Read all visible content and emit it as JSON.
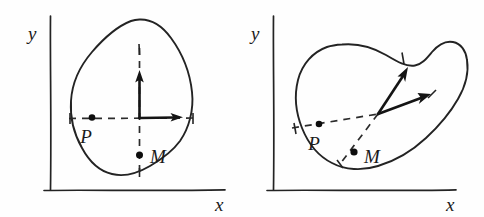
{
  "figure": {
    "title": "",
    "background_color": "#fefefe",
    "ink_color": "#232323",
    "width": 484,
    "height": 217,
    "panel_count": 2
  },
  "panels": [
    {
      "id": "left",
      "name": "unrotated-body-frame",
      "axes": {
        "x_label": "x",
        "y_label": "y",
        "x_axis_name": "horizontal-axis",
        "y_axis_name": "vertical-axis"
      },
      "body": {
        "name": "rigid-body-outline",
        "shape": "teardrop"
      },
      "points": [
        {
          "label": "P",
          "name": "point-p",
          "role": "material-point"
        },
        {
          "label": "M",
          "name": "point-m",
          "role": "mass-center"
        }
      ],
      "vectors": [
        {
          "name": "body-frame-axis-vertical",
          "direction": "up"
        },
        {
          "name": "body-frame-axis-horizontal",
          "direction": "right"
        }
      ],
      "guides": [
        {
          "name": "horizontal-dashed-guide",
          "style": "dashed"
        },
        {
          "name": "vertical-dashed-guide",
          "style": "dashed"
        }
      ]
    },
    {
      "id": "right",
      "name": "rotated-deformed-body-frame",
      "axes": {
        "x_label": "x",
        "y_label": "y",
        "x_axis_name": "horizontal-axis",
        "y_axis_name": "vertical-axis"
      },
      "body": {
        "name": "rigid-body-outline",
        "shape": "kidney"
      },
      "points": [
        {
          "label": "P",
          "name": "point-p",
          "role": "material-point"
        },
        {
          "label": "M",
          "name": "point-m",
          "role": "mass-center"
        }
      ],
      "vectors": [
        {
          "name": "body-frame-axis-rotated-1",
          "direction": "up-right-steep"
        },
        {
          "name": "body-frame-axis-rotated-2",
          "direction": "right-shallow"
        }
      ],
      "guides": [
        {
          "name": "chord-dashed-guide",
          "style": "dashed"
        },
        {
          "name": "radial-dashed-guide",
          "style": "dashed"
        }
      ]
    }
  ]
}
